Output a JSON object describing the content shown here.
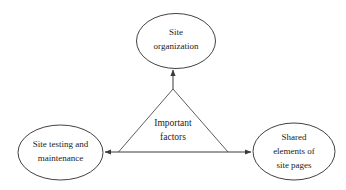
{
  "diagram": {
    "title": "Important factors",
    "background_color": "#ffffff",
    "stroke_color": "#2b2b2b",
    "text_color": "#1c1c1c",
    "center_label": {
      "line1": "Important",
      "line2": "factors"
    },
    "nodes": [
      {
        "id": "site-organization",
        "position": "top",
        "line1": "Site",
        "line2": "organization",
        "line3": ""
      },
      {
        "id": "site-testing-and-maintenance",
        "position": "left",
        "line1": "Site testing and",
        "line2": "maintenance",
        "line3": ""
      },
      {
        "id": "shared-elements-of-site-pages",
        "position": "right",
        "line1": "Shared",
        "line2": "elements of",
        "line3": "site pages"
      }
    ],
    "connectors": [
      {
        "id": "center-to-top",
        "from": "center",
        "to": "site-organization",
        "arrow": "single"
      },
      {
        "id": "left-to-right",
        "from": "site-testing-and-maintenance",
        "to": "shared-elements-of-site-pages",
        "arrow": "double"
      }
    ]
  }
}
